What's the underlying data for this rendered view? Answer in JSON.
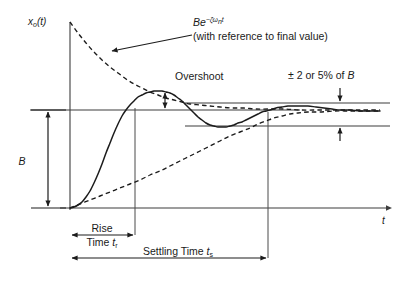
{
  "figure": {
    "background_color": "#ffffff",
    "line_color": "#1c1c1c",
    "axis_color": "#3d3d3d"
  },
  "axes": {
    "y_label": "x",
    "y_label_sub": "o",
    "y_label_tail": "(t)",
    "x_label": "t"
  },
  "annotations": {
    "envelope": {
      "formula_base": "Be",
      "formula_exponent": "−ζω",
      "formula_exponent_sub": "n",
      "formula_exponent_tail": "t",
      "note": "(with reference to final value)"
    },
    "overshoot_label": "Overshoot",
    "tolerance_label": "± 2 or 5% of ",
    "tolerance_label_italic": "B",
    "amplitude_label": "B",
    "rise_time_line1": "Rise",
    "rise_time_line2": "Time ",
    "rise_time_symbol": "t",
    "rise_time_symbol_sub": "r",
    "settling_time_label": "Settling Time ",
    "settling_time_symbol": "t",
    "settling_time_symbol_sub": "s"
  },
  "chart_data": {
    "type": "line",
    "xlabel": "t",
    "ylabel": "x₀(t)",
    "grid": false,
    "legend": false,
    "final_value": 1.0,
    "amplitude_B": 1.0,
    "tolerance_percent": 5,
    "peak_value": 1.18,
    "peak_time_px": 165,
    "rise_time_px": 135,
    "settling_time_px": 268,
    "series": [
      {
        "name": "step response",
        "style": "solid",
        "points_px": [
          [
            70,
            208
          ],
          [
            74,
            207
          ],
          [
            78,
            205
          ],
          [
            82,
            202
          ],
          [
            86,
            197
          ],
          [
            90,
            191
          ],
          [
            94,
            183
          ],
          [
            98,
            174
          ],
          [
            102,
            164
          ],
          [
            106,
            153
          ],
          [
            110,
            143
          ],
          [
            114,
            133
          ],
          [
            118,
            124
          ],
          [
            122,
            116
          ],
          [
            126,
            110
          ],
          [
            130,
            105
          ],
          [
            134,
            101
          ],
          [
            138,
            97
          ],
          [
            142,
            95
          ],
          [
            146,
            93
          ],
          [
            150,
            92
          ],
          [
            154,
            91
          ],
          [
            158,
            91
          ],
          [
            162,
            91
          ],
          [
            166,
            92
          ],
          [
            170,
            93
          ],
          [
            174,
            95
          ],
          [
            178,
            98
          ],
          [
            182,
            101
          ],
          [
            186,
            105
          ],
          [
            190,
            109
          ],
          [
            194,
            113
          ],
          [
            198,
            117
          ],
          [
            202,
            120
          ],
          [
            206,
            123
          ],
          [
            210,
            125
          ],
          [
            214,
            126
          ],
          [
            218,
            127
          ],
          [
            222,
            127
          ],
          [
            226,
            127
          ],
          [
            230,
            126
          ],
          [
            234,
            125
          ],
          [
            238,
            123
          ],
          [
            242,
            122
          ],
          [
            246,
            120
          ],
          [
            250,
            118
          ],
          [
            254,
            116
          ],
          [
            258,
            114
          ],
          [
            262,
            112
          ],
          [
            266,
            111
          ],
          [
            270,
            110
          ],
          [
            276,
            108
          ],
          [
            282,
            107
          ],
          [
            288,
            106
          ],
          [
            294,
            106
          ],
          [
            300,
            106
          ],
          [
            308,
            106
          ],
          [
            316,
            107
          ],
          [
            324,
            108
          ],
          [
            332,
            109
          ],
          [
            340,
            110
          ],
          [
            350,
            110
          ],
          [
            360,
            111
          ],
          [
            370,
            111
          ],
          [
            380,
            111
          ]
        ]
      },
      {
        "name": "upper envelope",
        "style": "dashed",
        "points_px": [
          [
            70,
            22
          ],
          [
            78,
            33
          ],
          [
            86,
            43
          ],
          [
            94,
            52
          ],
          [
            102,
            60
          ],
          [
            110,
            67
          ],
          [
            118,
            73
          ],
          [
            126,
            79
          ],
          [
            134,
            84
          ],
          [
            142,
            88
          ],
          [
            150,
            92
          ],
          [
            158,
            95
          ],
          [
            166,
            98
          ],
          [
            174,
            100
          ],
          [
            182,
            102
          ],
          [
            190,
            104
          ],
          [
            200,
            105
          ],
          [
            210,
            106
          ],
          [
            220,
            107
          ],
          [
            232,
            108
          ],
          [
            244,
            108
          ],
          [
            256,
            109
          ],
          [
            270,
            109
          ],
          [
            285,
            109
          ],
          [
            300,
            110
          ],
          [
            320,
            110
          ],
          [
            340,
            110
          ],
          [
            360,
            110
          ],
          [
            380,
            110
          ]
        ]
      },
      {
        "name": "lower envelope",
        "style": "dashed",
        "points_px": [
          [
            70,
            208
          ],
          [
            80,
            204
          ],
          [
            90,
            200
          ],
          [
            100,
            196
          ],
          [
            110,
            192
          ],
          [
            120,
            188
          ],
          [
            130,
            184
          ],
          [
            140,
            180
          ],
          [
            150,
            175
          ],
          [
            160,
            171
          ],
          [
            170,
            166
          ],
          [
            180,
            161
          ],
          [
            190,
            156
          ],
          [
            200,
            151
          ],
          [
            210,
            146
          ],
          [
            220,
            141
          ],
          [
            230,
            136
          ],
          [
            240,
            132
          ],
          [
            250,
            128
          ],
          [
            258,
            124
          ],
          [
            266,
            121
          ],
          [
            274,
            118
          ],
          [
            282,
            116
          ],
          [
            290,
            114
          ],
          [
            298,
            113
          ],
          [
            308,
            112
          ],
          [
            320,
            112
          ],
          [
            334,
            111
          ],
          [
            350,
            111
          ],
          [
            366,
            111
          ],
          [
            380,
            111
          ]
        ]
      }
    ],
    "reference_levels_px": {
      "final_value_y": 110,
      "baseline_y": 208,
      "tolerance_upper_y": 103,
      "tolerance_lower_y": 126,
      "axis_x": 70,
      "axis_top_y": 22,
      "axis_right_x": 390
    }
  }
}
